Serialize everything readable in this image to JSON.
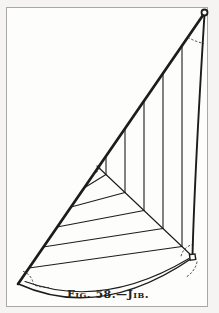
{
  "figure": {
    "caption": "Fig. 58.—Jib."
  },
  "colors": {
    "page_bg": "#f5f4f2",
    "paper": "#fdfdfc",
    "frame_border": "#a8a8a8",
    "ink": "#1c1c1c",
    "ink_dotted": "#2e2e2e",
    "caption_text": "#222222"
  },
  "diagram": {
    "corners": {
      "head": {
        "x": 204.5,
        "y": 12.5,
        "marker": "ring"
      },
      "tack": {
        "x": 18,
        "y": 284,
        "marker": "plain"
      },
      "clew": {
        "x": 192.5,
        "y": 257,
        "marker": "square"
      }
    },
    "edges": [
      {
        "name": "luff",
        "d": "M18,284 L204.5,13",
        "w": 2.7
      },
      {
        "name": "leech",
        "d": "M204.5,14 C199.5,95 194.5,180 192.5,255.5",
        "w": 1.9
      },
      {
        "name": "foot-outer",
        "d": "M18.5,284 Q100,321 191.5,258.5",
        "w": 1.5
      },
      {
        "name": "foot-inner",
        "d": "M25,281.5 Q103,310 189,258.5",
        "w": 1.05
      },
      {
        "name": "miter",
        "d": "M97,166 L192,256",
        "w": 1.15
      }
    ],
    "seams_upper": [
      "M106,156 L106,174.5",
      "M125,128.5 L125,192.5",
      "M144,101 L144,210.5",
      "M163,73.5 L163,228.5",
      "M182,46 L182,246.5"
    ],
    "seams_lower": [
      "M106,174.5 L84,188",
      "M125,192.5 L71,207",
      "M144,210.5 L57,227",
      "M163,228.5 L43,247",
      "M182,246.5 L29,268"
    ],
    "dotted_details": [
      {
        "name": "head-angle-arc",
        "d": "M188,37.5 Q195.5,41.5 203.5,43.5"
      },
      {
        "name": "clew-angle-arc",
        "d": "M193.5,244.5 C187,245.5 182,250 180.5,258.5"
      },
      {
        "name": "clew-outer-dots",
        "d": "M197,262 C195.5,268.5 191.5,274 185.5,277.5"
      },
      {
        "name": "tack-angle-arc",
        "d": "M23.5,271.5 C29,273.5 32.5,278.5 33.5,284.5"
      },
      {
        "name": "tack-foot-dots",
        "d": "M35.5,285.5 C40,287 44.5,287.5 48.5,287.5"
      },
      {
        "name": "miter-junction-dots",
        "d": "M93,174.5 C97,172.5 100,169.5 100.5,165.5"
      }
    ],
    "markers": {
      "head_ring": {
        "cx": 204.5,
        "cy": 12.5,
        "r": 3,
        "stroke_w": 1.8
      },
      "clew_square": {
        "x": 189.8,
        "y": 254.3,
        "size": 5.6,
        "stroke_w": 1.4,
        "rotate": -8
      }
    }
  }
}
